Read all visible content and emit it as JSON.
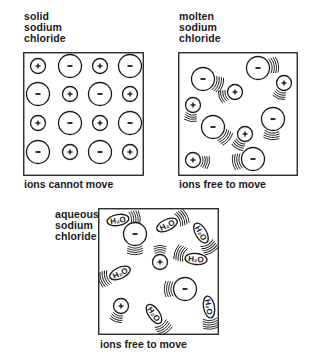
{
  "diagram": {
    "panels": [
      {
        "id": "solid",
        "title": "solid\nsodium\nchloride",
        "caption": "ions cannot move",
        "ions": [
          {
            "charge": "+",
            "x": 15,
            "y": 14
          },
          {
            "charge": "-",
            "x": 47,
            "y": 14
          },
          {
            "charge": "+",
            "x": 77,
            "y": 14
          },
          {
            "charge": "-",
            "x": 107,
            "y": 14
          },
          {
            "charge": "-",
            "x": 15,
            "y": 42
          },
          {
            "charge": "+",
            "x": 47,
            "y": 42
          },
          {
            "charge": "-",
            "x": 77,
            "y": 42
          },
          {
            "charge": "+",
            "x": 107,
            "y": 42
          },
          {
            "charge": "+",
            "x": 15,
            "y": 71
          },
          {
            "charge": "-",
            "x": 47,
            "y": 71
          },
          {
            "charge": "+",
            "x": 77,
            "y": 71
          },
          {
            "charge": "-",
            "x": 107,
            "y": 71
          },
          {
            "charge": "-",
            "x": 15,
            "y": 100
          },
          {
            "charge": "+",
            "x": 47,
            "y": 100
          },
          {
            "charge": "-",
            "x": 77,
            "y": 100
          },
          {
            "charge": "+",
            "x": 107,
            "y": 100
          }
        ]
      },
      {
        "id": "molten",
        "title": "molten\nsodium\nchloride",
        "caption": "ions free to move",
        "ions": [
          {
            "charge": "-",
            "x": 25,
            "y": 27,
            "motion": 20
          },
          {
            "charge": "-",
            "x": 80,
            "y": 16,
            "motion": -10
          },
          {
            "charge": "+",
            "x": 57,
            "y": 40,
            "motion": 160
          },
          {
            "charge": "+",
            "x": 106,
            "y": 31,
            "motion": 110
          },
          {
            "charge": "+",
            "x": 15,
            "y": 53,
            "motion": 100
          },
          {
            "charge": "-",
            "x": 95,
            "y": 67,
            "motion": 95
          },
          {
            "charge": "-",
            "x": 35,
            "y": 75,
            "motion": 40
          },
          {
            "charge": "+",
            "x": 67,
            "y": 82,
            "motion": 120
          },
          {
            "charge": "+",
            "x": 15,
            "y": 108,
            "motion": 10
          },
          {
            "charge": "-",
            "x": 75,
            "y": 107,
            "motion": 170
          }
        ]
      },
      {
        "id": "aqueous",
        "title": "aqueous\nsodium\nchloride",
        "caption": "ions free to move",
        "ions": [
          {
            "charge": "-",
            "x": 37,
            "y": 26,
            "motion": 90
          },
          {
            "charge": "+",
            "x": 62,
            "y": 54,
            "motion": -90
          },
          {
            "charge": "-",
            "x": 87,
            "y": 81,
            "motion": 180
          },
          {
            "charge": "+",
            "x": 23,
            "y": 98,
            "motion": 110
          }
        ],
        "water_molecules": [
          {
            "label": "H₂O",
            "x": 20,
            "y": 12,
            "rotate": -10,
            "motion": -5
          },
          {
            "label": "H₂O",
            "x": 69,
            "y": 17,
            "rotate": -25,
            "motion": -25
          },
          {
            "label": "H₂O",
            "x": 103,
            "y": 25,
            "rotate": 60,
            "motion": 60
          },
          {
            "label": "H₂O",
            "x": 98,
            "y": 51,
            "rotate": 5,
            "motion": 200
          },
          {
            "label": "H₂O",
            "x": 22,
            "y": 65,
            "rotate": -25,
            "motion": 160
          },
          {
            "label": "H₂O",
            "x": 56,
            "y": 106,
            "rotate": 55,
            "motion": 55
          },
          {
            "label": "H₂O",
            "x": 111,
            "y": 99,
            "rotate": 80,
            "motion": 85
          }
        ]
      }
    ],
    "colors": {
      "ink": "#1a1a1a",
      "background": "#ffffff"
    }
  }
}
